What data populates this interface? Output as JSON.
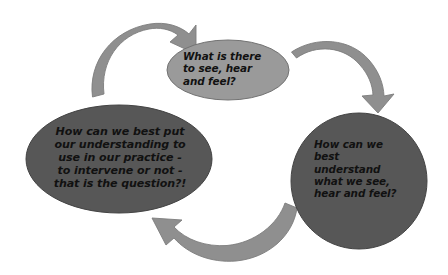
{
  "diagram": {
    "type": "cycle",
    "background_color": "#ffffff",
    "nodes": [
      {
        "id": "observe",
        "name": "observe-node",
        "text": "What is there\nto see, hear\nand feel?",
        "shape": "ellipse",
        "fill_color": "#9a9a9a",
        "stroke_color": "#6f6f6f",
        "text_color": "#111111",
        "text_align": "left",
        "cx": 228,
        "cy": 70,
        "rx": 61,
        "ry": 30
      },
      {
        "id": "understand",
        "name": "understand-node",
        "text": "How can we\nbest\nunderstand\nwhat we see,\nhear and feel?",
        "shape": "circle",
        "fill_color": "#575757",
        "stroke_color": "#3f3f3f",
        "text_color": "#111111",
        "text_align": "left",
        "cx": 359,
        "cy": 181,
        "rx": 68,
        "ry": 68
      },
      {
        "id": "apply",
        "name": "apply-node",
        "text": "How can we best put\nour understanding to\nuse in our practice -\nto intervene or not -\nthat is the question?!",
        "shape": "ellipse",
        "fill_color": "#575757",
        "stroke_color": "#3f3f3f",
        "text_color": "#111111",
        "text_align": "center",
        "cx": 119,
        "cy": 159,
        "rx": 93,
        "ry": 54
      }
    ],
    "arrows": [
      {
        "id": "arrow-apply-to-observe",
        "name": "arrow-apply-to-observe",
        "from": "apply",
        "to": "observe",
        "color": "#8f8f8f",
        "stroke_color": "#7a7a7a",
        "direction": "clockwise"
      },
      {
        "id": "arrow-observe-to-understand",
        "name": "arrow-observe-to-understand",
        "from": "observe",
        "to": "understand",
        "color": "#8f8f8f",
        "stroke_color": "#7a7a7a",
        "direction": "clockwise"
      },
      {
        "id": "arrow-understand-to-apply",
        "name": "arrow-understand-to-apply",
        "from": "understand",
        "to": "apply",
        "color": "#8f8f8f",
        "stroke_color": "#7a7a7a",
        "direction": "clockwise"
      }
    ]
  }
}
